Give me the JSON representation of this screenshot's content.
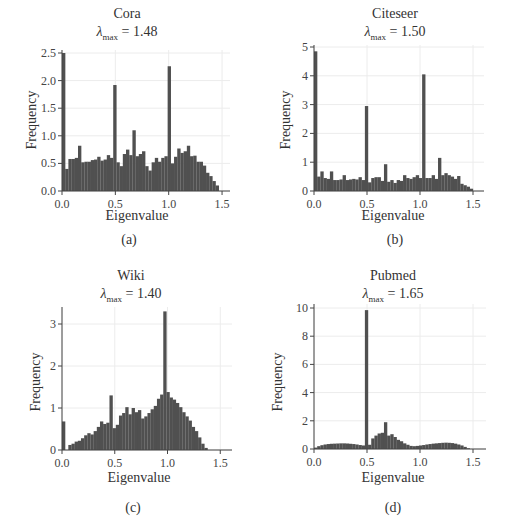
{
  "chart_data": [
    {
      "type": "bar",
      "panel": "a",
      "title": "Cora",
      "subtitle": "λmax = 1.48",
      "lambda_max": "1.48",
      "caption": "(a)",
      "xlabel": "Eigenvalue",
      "ylabel": "Frequency",
      "xlim": [
        0,
        1.6
      ],
      "ylim": [
        0,
        2.5
      ],
      "xticks": [
        "0.0",
        "0.5",
        "1.0",
        "1.5"
      ],
      "yticks": [
        "0.0",
        "0.5",
        "1.0",
        "1.5",
        "2.0",
        "2.5"
      ],
      "grid": true,
      "bin_width": 0.03,
      "bin_start": 0.0,
      "values": [
        2.5,
        0.4,
        0.58,
        0.58,
        0.6,
        0.82,
        0.52,
        0.53,
        0.53,
        0.56,
        0.57,
        0.62,
        0.55,
        0.57,
        0.65,
        0.6,
        1.92,
        0.52,
        0.45,
        0.67,
        0.75,
        0.65,
        1.1,
        0.63,
        0.67,
        0.72,
        0.45,
        0.37,
        0.52,
        0.6,
        0.53,
        0.6,
        0.63,
        2.26,
        0.5,
        0.62,
        0.77,
        0.69,
        0.72,
        0.82,
        0.63,
        0.64,
        0.53,
        0.53,
        0.46,
        0.33,
        0.27,
        0.18,
        0.1
      ]
    },
    {
      "type": "bar",
      "panel": "b",
      "title": "Citeseer",
      "subtitle": "λmax = 1.50",
      "lambda_max": "1.50",
      "caption": "(b)",
      "xlabel": "Eigenvalue",
      "ylabel": "Frequency",
      "xlim": [
        0,
        1.6
      ],
      "ylim": [
        0,
        5
      ],
      "xticks": [
        "0.0",
        "0.5",
        "1.0",
        "1.5"
      ],
      "yticks": [
        "0",
        "1",
        "2",
        "3",
        "4",
        "5"
      ],
      "grid": true,
      "bin_width": 0.03,
      "bin_start": 0.0,
      "values": [
        4.85,
        0.5,
        0.68,
        0.45,
        0.42,
        0.68,
        0.38,
        0.38,
        0.4,
        0.55,
        0.38,
        0.4,
        0.42,
        0.4,
        0.48,
        0.38,
        2.95,
        0.3,
        0.45,
        0.48,
        0.48,
        0.35,
        0.93,
        0.32,
        0.38,
        0.28,
        0.38,
        0.35,
        0.55,
        0.45,
        0.42,
        0.48,
        0.55,
        0.45,
        4.05,
        0.45,
        0.45,
        0.55,
        0.42,
        1.15,
        0.55,
        0.62,
        0.55,
        0.5,
        0.42,
        0.52,
        0.25,
        0.2,
        0.15,
        0.08
      ]
    },
    {
      "type": "bar",
      "panel": "c",
      "title": "Wiki",
      "subtitle": "λmax = 1.40",
      "lambda_max": "1.40",
      "caption": "(c)",
      "xlabel": "Eigenvalue",
      "ylabel": "Frequency",
      "xlim": [
        0,
        1.6
      ],
      "ylim": [
        0,
        3.4
      ],
      "xticks": [
        "0.0",
        "0.5",
        "1.0",
        "1.5"
      ],
      "yticks": [
        "0",
        "1",
        "2",
        "3"
      ],
      "grid": true,
      "bin_width": 0.03,
      "bin_start": 0.0,
      "values": [
        0.68,
        0.0,
        0.12,
        0.15,
        0.2,
        0.22,
        0.28,
        0.35,
        0.4,
        0.37,
        0.45,
        0.55,
        0.68,
        0.62,
        0.65,
        1.3,
        0.52,
        0.6,
        0.82,
        0.88,
        1.02,
        0.85,
        1.0,
        0.9,
        0.95,
        0.75,
        0.8,
        0.88,
        0.97,
        1.05,
        1.22,
        1.32,
        3.3,
        1.38,
        1.25,
        1.2,
        1.12,
        1.02,
        0.9,
        0.8,
        0.7,
        0.55,
        0.45,
        0.3,
        0.15,
        0.05
      ]
    },
    {
      "type": "bar",
      "panel": "d",
      "title": "Pubmed",
      "subtitle": "λmax = 1.65",
      "lambda_max": "1.65",
      "caption": "(d)",
      "xlabel": "Eigenvalue",
      "ylabel": "Frequency",
      "xlim": [
        0,
        1.6
      ],
      "ylim": [
        0,
        10.3
      ],
      "xticks": [
        "0.0",
        "0.5",
        "1.0",
        "1.5"
      ],
      "yticks": [
        "0",
        "2",
        "4",
        "6",
        "8",
        "10"
      ],
      "grid": true,
      "bin_width": 0.03,
      "bin_start": 0.0,
      "values": [
        0.1,
        0.2,
        0.27,
        0.32,
        0.35,
        0.37,
        0.38,
        0.39,
        0.4,
        0.4,
        0.39,
        0.37,
        0.35,
        0.32,
        0.28,
        0.25,
        9.85,
        0.3,
        0.75,
        0.95,
        1.1,
        1.15,
        1.9,
        0.95,
        1.05,
        0.85,
        0.65,
        0.55,
        0.4,
        0.3,
        0.22,
        0.2,
        0.22,
        0.25,
        0.28,
        0.32,
        0.35,
        0.38,
        0.4,
        0.42,
        0.44,
        0.45,
        0.44,
        0.42,
        0.38,
        0.32,
        0.25,
        0.15,
        0.05
      ]
    }
  ],
  "colors": {
    "bar": "#505050",
    "axis": "#444444",
    "grid": "#ececec",
    "text": "#333333"
  },
  "panels": [
    {
      "title": "Cora",
      "lambda_value": "1.48",
      "caption": "(a)",
      "xlabel": "Eigenvalue",
      "ylabel": "Frequency"
    },
    {
      "title": "Citeseer",
      "lambda_value": "1.50",
      "caption": "(b)",
      "xlabel": "Eigenvalue",
      "ylabel": "Frequency"
    },
    {
      "title": "Wiki",
      "lambda_value": "1.40",
      "caption": "(c)",
      "xlabel": "Eigenvalue",
      "ylabel": "Frequency"
    },
    {
      "title": "Pubmed",
      "lambda_value": "1.65",
      "caption": "(d)",
      "xlabel": "Eigenvalue",
      "ylabel": "Frequency"
    }
  ],
  "lambda_symbol": "λ",
  "lambda_sub": "max",
  "lambda_eq": " = "
}
